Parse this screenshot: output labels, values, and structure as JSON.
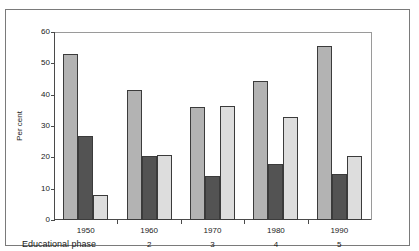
{
  "chart_data": {
    "type": "bar",
    "title": "",
    "xlabel": "Educational phase",
    "ylabel": "Per cent",
    "ylim": [
      0,
      60
    ],
    "yticks": [
      0,
      10,
      20,
      30,
      40,
      50,
      60
    ],
    "grid": false,
    "legend": "none",
    "categories": [
      "1950",
      "1960",
      "1970",
      "1980",
      "1990"
    ],
    "secondary_categories": [
      "",
      "2",
      "3",
      "4",
      "5"
    ],
    "series": [
      {
        "name": "series-1",
        "color": "#b3b3b3",
        "values": [
          53.0,
          41.5,
          36.0,
          44.5,
          55.5
        ]
      },
      {
        "name": "series-2",
        "color": "#535353",
        "values": [
          26.8,
          20.3,
          14.0,
          17.8,
          14.7
        ]
      },
      {
        "name": "series-3",
        "color": "#dddddd",
        "values": [
          8.0,
          20.8,
          36.5,
          32.8,
          20.3
        ]
      }
    ]
  },
  "axis": {
    "y_label": "Per cent",
    "x_title": "Educational phase",
    "ticks": [
      "60",
      "50",
      "40",
      "30",
      "20",
      "10",
      "0"
    ]
  }
}
